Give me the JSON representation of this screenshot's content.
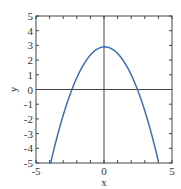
{
  "chart_data": {
    "type": "line",
    "title": "",
    "xlabel": "x",
    "ylabel": "y",
    "xlim": [
      -5,
      5
    ],
    "ylim": [
      -5,
      5
    ],
    "grid": false,
    "zero_axes": true,
    "x_tick_labels": [
      "-5",
      "0",
      "5"
    ],
    "x_tick_values": [
      -5,
      0,
      5
    ],
    "y_tick_labels": [
      "5",
      "4",
      "3",
      "2",
      "1",
      "0",
      "-1",
      "-2",
      "-3",
      "-4",
      "-5"
    ],
    "y_tick_values": [
      5,
      4,
      3,
      2,
      1,
      0,
      -1,
      -2,
      -3,
      -4,
      -5
    ],
    "minor_x_ticks": [
      -4,
      -3,
      -2,
      -1,
      1,
      2,
      3,
      4
    ],
    "series": [
      {
        "name": "y = 3 - 0.5x^2",
        "color": "#3a6fb5",
        "function": {
          "a": -0.5,
          "h": 0.05,
          "k": 2.9
        },
        "x_range": [
          -4,
          4
        ],
        "points": [
          {
            "x": -4,
            "y": -5
          },
          {
            "x": -3,
            "y": -1.6
          },
          {
            "x": -2.45,
            "y": 0
          },
          {
            "x": -2,
            "y": 0.9
          },
          {
            "x": -1,
            "y": 2.4
          },
          {
            "x": 0,
            "y": 2.9
          },
          {
            "x": 1,
            "y": 2.4
          },
          {
            "x": 2,
            "y": 0.9
          },
          {
            "x": 2.45,
            "y": 0
          },
          {
            "x": 3,
            "y": -1.6
          },
          {
            "x": 4,
            "y": -5
          }
        ]
      }
    ]
  }
}
